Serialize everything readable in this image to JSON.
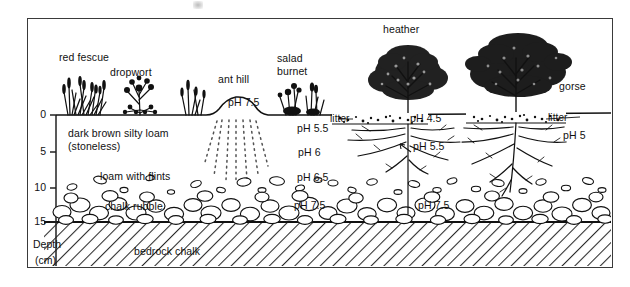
{
  "figure": {
    "type": "soil-profile-cross-section",
    "axis": {
      "caption_line1": "Depth",
      "caption_line2": "(cm)",
      "ticks": [
        "0",
        "5",
        "10",
        "15"
      ],
      "unit": "cm",
      "range": [
        0,
        15
      ]
    },
    "plants": [
      {
        "name": "red fescue"
      },
      {
        "name": "dropwort"
      },
      {
        "name": "ant hill"
      },
      {
        "name": "salad"
      },
      {
        "name": "burnet"
      },
      {
        "name": "heather"
      },
      {
        "name": "gorse"
      }
    ],
    "horizons": [
      {
        "label_line1": "dark brown silty loam",
        "label_line2": "(stoneless)"
      },
      {
        "label": "loam with flints"
      },
      {
        "label": "chalk rubble"
      },
      {
        "label": "bedrock chalk"
      }
    ],
    "litter_labels": [
      "litter",
      "litter"
    ],
    "ph_readings": [
      {
        "value": "pH 7.5",
        "context": "ant hill"
      },
      {
        "value": "pH 5.5",
        "context": "grassland topsoil"
      },
      {
        "value": "pH 6",
        "context": "grassland mid soil"
      },
      {
        "value": "pH 6.5",
        "context": "loam with flints"
      },
      {
        "value": "pH 7.5",
        "context": "chalk rubble left"
      },
      {
        "value": "pH 4.5",
        "context": "heather litter"
      },
      {
        "value": "pH 5.5",
        "context": "heather root zone"
      },
      {
        "value": "pH 7.5",
        "context": "chalk rubble right"
      },
      {
        "value": "pH 5",
        "context": "gorse root zone"
      }
    ]
  }
}
